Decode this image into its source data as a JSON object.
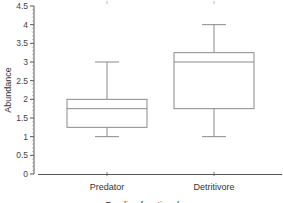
{
  "chart_data": {
    "type": "box",
    "title": "",
    "xlabel": "Feeding functional group",
    "ylabel": "Abundance",
    "ylim": [
      0,
      4.5
    ],
    "yticks": [
      0,
      0.5,
      1,
      1.5,
      2,
      2.5,
      3,
      3.5,
      4,
      4.5
    ],
    "ytick_labels": [
      "0",
      "0.5",
      "1",
      "1.5",
      "2",
      "2.5",
      "3",
      "3.5",
      "4",
      "4.5"
    ],
    "categories": [
      "Predator",
      "Detritivore"
    ],
    "grid": false,
    "legend": null,
    "series": [
      {
        "name": "Predator",
        "whisker_low": 1.0,
        "q1": 1.25,
        "median": 1.75,
        "q3": 2.0,
        "whisker_high": 3.0
      },
      {
        "name": "Detritivore",
        "whisker_low": 1.0,
        "q1": 1.75,
        "median": 3.0,
        "q3": 3.25,
        "whisker_high": 4.0
      }
    ],
    "colors": {
      "box": "#8a8a8a",
      "axis": "#555555"
    }
  }
}
